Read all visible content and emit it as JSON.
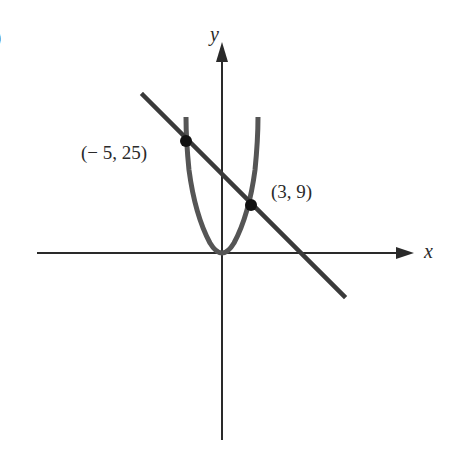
{
  "figure": {
    "part_marker": ")",
    "axes": {
      "x_label": "x",
      "y_label": "y"
    },
    "curves": [
      {
        "name": "parabola",
        "equation": "y = x^2",
        "color": "#555555"
      },
      {
        "name": "line",
        "equation": "y = -2x + 15",
        "color": "#3a3a3a"
      }
    ],
    "points": [
      {
        "label": "(− 5, 25)",
        "x": -5,
        "y": 25
      },
      {
        "label": "(3, 9)",
        "x": 3,
        "y": 9
      }
    ],
    "colors": {
      "axis": "#2a2a2a",
      "parabola": "#555555",
      "line": "#3a3a3a",
      "point": "#111111",
      "text": "#2a2a2a"
    }
  }
}
